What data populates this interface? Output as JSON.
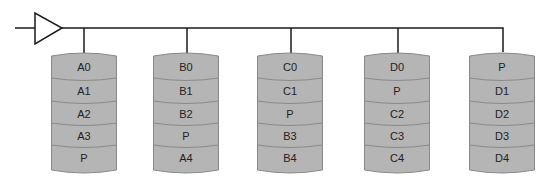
{
  "diagram": {
    "type": "RAID 5 striping with distributed parity",
    "colors": {
      "disk_fill": "#b5b5b5",
      "disk_stroke": "#888888",
      "line": "#1a1a1a",
      "text": "#222222"
    },
    "controller": {
      "shape": "triangle"
    },
    "disks": [
      {
        "id": "disk-1",
        "blocks": [
          "A0",
          "A1",
          "A2",
          "A3",
          "P"
        ]
      },
      {
        "id": "disk-2",
        "blocks": [
          "B0",
          "B1",
          "B2",
          "P",
          "A4"
        ]
      },
      {
        "id": "disk-3",
        "blocks": [
          "C0",
          "C1",
          "P",
          "B3",
          "B4"
        ]
      },
      {
        "id": "disk-4",
        "blocks": [
          "D0",
          "P",
          "C2",
          "C3",
          "C4"
        ]
      },
      {
        "id": "disk-5",
        "blocks": [
          "P",
          "D1",
          "D2",
          "D3",
          "D4"
        ]
      }
    ]
  }
}
